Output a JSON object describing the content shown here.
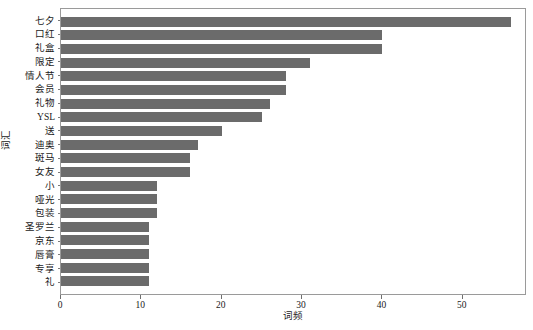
{
  "chart_data": {
    "type": "bar",
    "orientation": "horizontal",
    "title": "",
    "xlabel": "词频",
    "ylabel": "词汇",
    "grid": false,
    "legend": null,
    "xlim": [
      0,
      58
    ],
    "xticks": [
      0,
      10,
      20,
      30,
      40,
      50
    ],
    "bar_color": "#6b6b6b",
    "frame_color": "#9a9a9a",
    "categories": [
      "七夕",
      "口红",
      "礼盒",
      "限定",
      "情人节",
      "会员",
      "礼物",
      "YSL",
      "送",
      "迪奥",
      "斑马",
      "女友",
      "小",
      "哑光",
      "包装",
      "圣罗兰",
      "京东",
      "唇膏",
      "专享",
      "礼"
    ],
    "values": [
      56,
      40,
      40,
      31,
      28,
      28,
      26,
      25,
      20,
      17,
      16,
      16,
      12,
      12,
      12,
      11,
      11,
      11,
      11,
      11
    ]
  }
}
